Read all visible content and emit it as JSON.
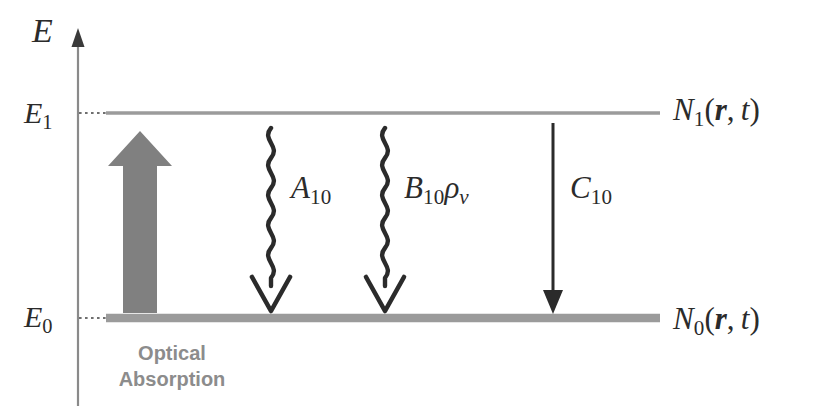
{
  "diagram": {
    "axis": {
      "name": "energy-axis",
      "label": "E",
      "direction": "up"
    },
    "levels": [
      {
        "id": "upper",
        "axis_label_base": "E",
        "axis_label_sub": "1",
        "population_base": "N",
        "population_sub": "1",
        "population_args": "(r, t)",
        "population_arg_vector": "r",
        "population_arg_time": "t",
        "y": 113,
        "thickness_px": 3,
        "color": "#9b9b9b"
      },
      {
        "id": "lower",
        "axis_label_base": "E",
        "axis_label_sub": "0",
        "population_base": "N",
        "population_sub": "0",
        "population_args": "(r, t)",
        "population_arg_vector": "r",
        "population_arg_time": "t",
        "y": 318,
        "thickness_px": 8,
        "color": "#9b9b9b"
      }
    ],
    "transitions": [
      {
        "name": "optical-absorption",
        "style": "block-arrow",
        "direction": "up",
        "color": "#808080",
        "caption": "Optical\nAbsorption",
        "caption_color": "#8c8c8c"
      },
      {
        "name": "spontaneous-emission",
        "style": "wavy-arrow",
        "direction": "down",
        "color": "#2b2b2b",
        "label_base": "A",
        "label_sub": "10"
      },
      {
        "name": "stimulated-emission",
        "style": "wavy-arrow",
        "direction": "down",
        "color": "#2b2b2b",
        "label_base": "B",
        "label_sub": "10",
        "label_extra_rho": "ρ",
        "label_extra_rho_sub": "v"
      },
      {
        "name": "nonradiative-relaxation",
        "style": "straight-arrow",
        "direction": "down",
        "color": "#2b2b2b",
        "label_base": "C",
        "label_sub": "10"
      }
    ],
    "colors": {
      "ink": "#2b2b2b",
      "level_gray": "#9b9b9b",
      "arrow_gray": "#808080",
      "caption_gray": "#8c8c8c",
      "background": "#ffffff"
    }
  }
}
